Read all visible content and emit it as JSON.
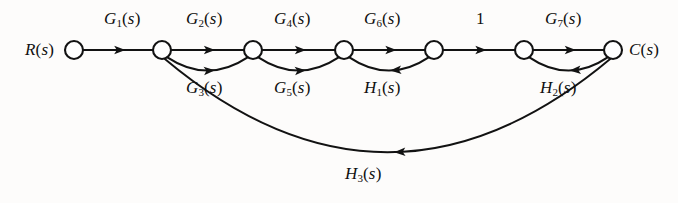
{
  "figure": {
    "kind": "signal-flow-graph",
    "background_color": "#fdfcfb",
    "stroke_color": "#121212",
    "node_fill": "#ffffff"
  },
  "nodes": [
    {
      "id": "n1",
      "label": "R(s)",
      "label_side": "left",
      "x": 74,
      "y": 50,
      "r": 9
    },
    {
      "id": "n2",
      "label": "",
      "label_side": "none",
      "x": 162,
      "y": 50,
      "r": 9
    },
    {
      "id": "n3",
      "label": "",
      "label_side": "none",
      "x": 253,
      "y": 50,
      "r": 9
    },
    {
      "id": "n4",
      "label": "",
      "label_side": "none",
      "x": 344,
      "y": 50,
      "r": 9
    },
    {
      "id": "n5",
      "label": "",
      "label_side": "none",
      "x": 434,
      "y": 50,
      "r": 9
    },
    {
      "id": "n6",
      "label": "",
      "label_side": "none",
      "x": 524,
      "y": 50,
      "r": 9
    },
    {
      "id": "n7",
      "label": "C(s)",
      "label_side": "right",
      "x": 613,
      "y": 50,
      "r": 9
    }
  ],
  "node_labels": [
    {
      "text": "R(s)",
      "base": "R",
      "sub": "",
      "tail": "(s)",
      "x": 25,
      "y": 50
    },
    {
      "text": "C(s)",
      "base": "C",
      "sub": "",
      "tail": "(s)",
      "x": 629,
      "y": 50
    }
  ],
  "branches": [
    {
      "id": "b-g1",
      "label": "G1(s)",
      "base": "G",
      "sub": "1",
      "tail": "(s)",
      "from": "n1",
      "to": "n2",
      "shape": "straight",
      "direction": "forward",
      "label_x": 104,
      "label_y": 17
    },
    {
      "id": "b-g2",
      "label": "G2(s)",
      "base": "G",
      "sub": "2",
      "tail": "(s)",
      "from": "n2",
      "to": "n3",
      "shape": "straight",
      "direction": "forward",
      "label_x": 186,
      "label_y": 17
    },
    {
      "id": "b-g3",
      "label": "G3(s)",
      "base": "G",
      "sub": "3",
      "tail": "(s)",
      "from": "n2",
      "to": "n3",
      "shape": "arc-below",
      "direction": "forward",
      "label_x": 186,
      "label_y": 86
    },
    {
      "id": "b-g4",
      "label": "G4(s)",
      "base": "G",
      "sub": "4",
      "tail": "(s)",
      "from": "n3",
      "to": "n4",
      "shape": "straight",
      "direction": "forward",
      "label_x": 274,
      "label_y": 17
    },
    {
      "id": "b-g5",
      "label": "G5(s)",
      "base": "G",
      "sub": "5",
      "tail": "(s)",
      "from": "n3",
      "to": "n4",
      "shape": "arc-below",
      "direction": "forward",
      "label_x": 274,
      "label_y": 86
    },
    {
      "id": "b-g6",
      "label": "G6(s)",
      "base": "G",
      "sub": "6",
      "tail": "(s)",
      "from": "n4",
      "to": "n5",
      "shape": "straight",
      "direction": "forward",
      "label_x": 364,
      "label_y": 17
    },
    {
      "id": "b-h1",
      "label": "H1(s)",
      "base": "H",
      "sub": "1",
      "tail": "(s)",
      "from": "n5",
      "to": "n4",
      "shape": "arc-below",
      "direction": "backward",
      "label_x": 364,
      "label_y": 86
    },
    {
      "id": "b-one",
      "label": "1",
      "base": "1",
      "sub": "",
      "tail": "",
      "from": "n5",
      "to": "n6",
      "shape": "straight",
      "direction": "forward",
      "label_x": 476,
      "label_y": 17
    },
    {
      "id": "b-g7",
      "label": "G7(s)",
      "base": "G",
      "sub": "7",
      "tail": "(s)",
      "from": "n6",
      "to": "n7",
      "shape": "straight",
      "direction": "forward",
      "label_x": 545,
      "label_y": 17
    },
    {
      "id": "b-h2",
      "label": "H2(s)",
      "base": "H",
      "sub": "2",
      "tail": "(s)",
      "from": "n7",
      "to": "n6",
      "shape": "arc-below",
      "direction": "backward",
      "label_x": 540,
      "label_y": 86
    },
    {
      "id": "b-h3",
      "label": "H3(s)",
      "base": "H",
      "sub": "3",
      "tail": "(s)",
      "from": "n7",
      "to": "n2",
      "shape": "arc-long-below",
      "direction": "backward",
      "label_x": 345,
      "label_y": 172
    }
  ]
}
